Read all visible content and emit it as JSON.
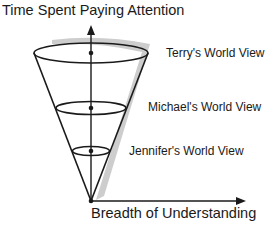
{
  "diagram": {
    "y_axis_label": "Time Spent Paying Attention",
    "x_axis_label": "Breadth of Understanding",
    "levels": [
      {
        "label": "Terry's World View"
      },
      {
        "label": "Michael's World View"
      },
      {
        "label": "Jennifer's World View"
      }
    ],
    "colors": {
      "line": "#1a1a1a",
      "shadow": "#bdbdbd",
      "background": "#ffffff"
    }
  }
}
